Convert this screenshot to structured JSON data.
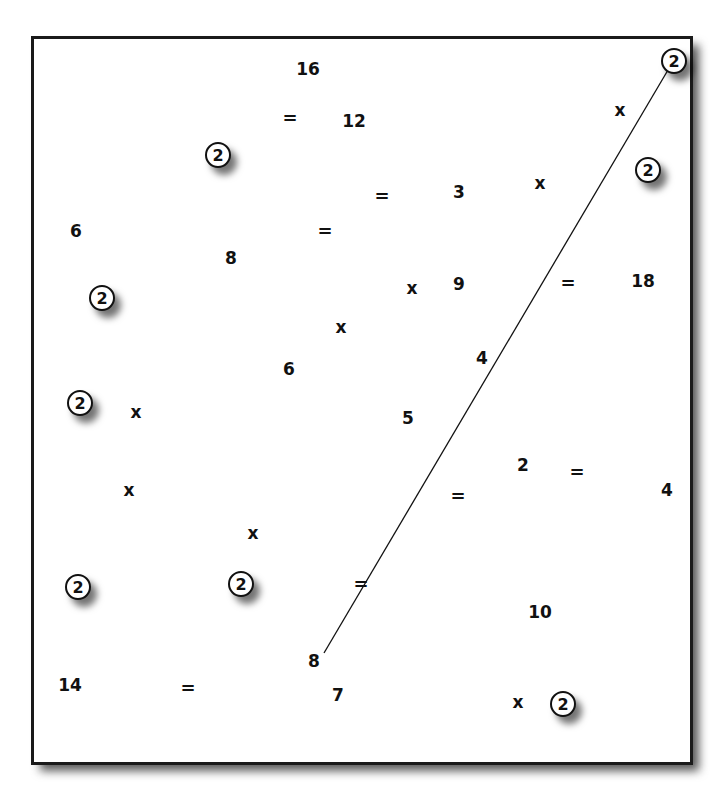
{
  "frame": {
    "border_color": "#1a1a1a",
    "background": "#ffffff",
    "shadow_color": "#5a5a5a"
  },
  "connector_line": {
    "x1": 668,
    "y1": 70,
    "x2": 324,
    "y2": 653,
    "color": "#111111"
  },
  "tokens": [
    {
      "text": "16",
      "kind": "number",
      "x": 308,
      "y": 69
    },
    {
      "text": "=",
      "kind": "equals",
      "x": 290,
      "y": 118
    },
    {
      "text": "12",
      "kind": "number",
      "x": 354,
      "y": 121
    },
    {
      "text": "2",
      "kind": "circled",
      "x": 218,
      "y": 155
    },
    {
      "text": "2",
      "kind": "circled",
      "x": 674,
      "y": 61
    },
    {
      "text": "x",
      "kind": "times",
      "x": 620,
      "y": 110
    },
    {
      "text": "2",
      "kind": "circled",
      "x": 648,
      "y": 170
    },
    {
      "text": "=",
      "kind": "equals",
      "x": 382,
      "y": 196
    },
    {
      "text": "3",
      "kind": "number",
      "x": 459,
      "y": 192
    },
    {
      "text": "x",
      "kind": "times",
      "x": 540,
      "y": 183
    },
    {
      "text": "6",
      "kind": "number",
      "x": 76,
      "y": 231
    },
    {
      "text": "=",
      "kind": "equals",
      "x": 325,
      "y": 231
    },
    {
      "text": "8",
      "kind": "number",
      "x": 231,
      "y": 258
    },
    {
      "text": "x",
      "kind": "times",
      "x": 412,
      "y": 288
    },
    {
      "text": "9",
      "kind": "number",
      "x": 459,
      "y": 284
    },
    {
      "text": "=",
      "kind": "equals",
      "x": 568,
      "y": 283
    },
    {
      "text": "18",
      "kind": "number",
      "x": 643,
      "y": 281
    },
    {
      "text": "2",
      "kind": "circled",
      "x": 102,
      "y": 298
    },
    {
      "text": "x",
      "kind": "times",
      "x": 341,
      "y": 327
    },
    {
      "text": "4",
      "kind": "number",
      "x": 482,
      "y": 358
    },
    {
      "text": "6",
      "kind": "number",
      "x": 289,
      "y": 369
    },
    {
      "text": "2",
      "kind": "circled",
      "x": 80,
      "y": 403
    },
    {
      "text": "x",
      "kind": "times",
      "x": 136,
      "y": 412
    },
    {
      "text": "5",
      "kind": "number",
      "x": 408,
      "y": 418
    },
    {
      "text": "2",
      "kind": "number",
      "x": 523,
      "y": 465
    },
    {
      "text": "=",
      "kind": "equals",
      "x": 577,
      "y": 472
    },
    {
      "text": "x",
      "kind": "times",
      "x": 129,
      "y": 490
    },
    {
      "text": "=",
      "kind": "equals",
      "x": 458,
      "y": 496
    },
    {
      "text": "4",
      "kind": "number",
      "x": 667,
      "y": 490
    },
    {
      "text": "x",
      "kind": "times",
      "x": 253,
      "y": 533
    },
    {
      "text": "2",
      "kind": "circled",
      "x": 78,
      "y": 587
    },
    {
      "text": "2",
      "kind": "circled",
      "x": 241,
      "y": 584
    },
    {
      "text": "=",
      "kind": "equals",
      "x": 361,
      "y": 584
    },
    {
      "text": "10",
      "kind": "number",
      "x": 540,
      "y": 612
    },
    {
      "text": "8",
      "kind": "number",
      "x": 314,
      "y": 661
    },
    {
      "text": "14",
      "kind": "number",
      "x": 70,
      "y": 685
    },
    {
      "text": "=",
      "kind": "equals",
      "x": 188,
      "y": 688
    },
    {
      "text": "7",
      "kind": "number",
      "x": 338,
      "y": 695
    },
    {
      "text": "x",
      "kind": "times",
      "x": 518,
      "y": 702
    },
    {
      "text": "2",
      "kind": "circled",
      "x": 563,
      "y": 704
    }
  ]
}
